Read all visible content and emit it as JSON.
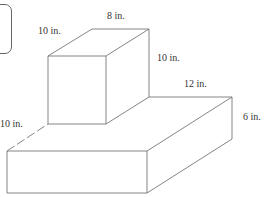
{
  "figure": {
    "type": "composite rectangular prism diagram",
    "labels": {
      "top_depth": "10 in.",
      "top_width": "8 in.",
      "top_height": "10 in.",
      "base_depth_right": "12 in.",
      "base_depth_left": "10 in.",
      "base_height": "6 in."
    },
    "colors": {
      "line": "#777777",
      "text": "#333333",
      "background": "#ffffff"
    }
  }
}
